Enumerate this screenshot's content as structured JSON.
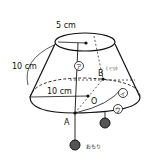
{
  "labels": {
    "top_radius": "5 cm",
    "slant": "10 cm",
    "bottom_radius": "10 cm",
    "point_a": "A",
    "point_b": "B",
    "point_b_note": "(ミツ)",
    "point_o": "O",
    "mark_a": "ア",
    "mark_i": "イ",
    "mark_u": "ウ",
    "weight": "おもり"
  }
}
